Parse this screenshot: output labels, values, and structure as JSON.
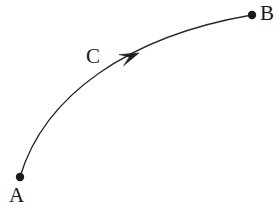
{
  "figure": {
    "width": 280,
    "height": 211,
    "background_color": "#ffffff",
    "stroke_color": "#2b2b2b",
    "stroke_width": 1.4
  },
  "labels": {
    "start": "A",
    "end": "B",
    "path": "C"
  },
  "points": [
    {
      "name": "point-a",
      "label": "A",
      "x": 20,
      "y": 177,
      "radius": 4.2
    },
    {
      "name": "point-b",
      "label": "B",
      "x": 252,
      "y": 15,
      "radius": 4.2
    }
  ],
  "curve": {
    "name": "arc-a-to-b",
    "from": {
      "x": 20,
      "y": 177
    },
    "to": {
      "x": 252,
      "y": 15
    },
    "control_1": {
      "x": 44,
      "y": 96
    },
    "control_2": {
      "x": 128,
      "y": 36
    },
    "direction": "A to B"
  },
  "arrowhead": {
    "name": "direction-arrowhead",
    "tip_x": 139,
    "tip_y": 53,
    "angle_deg": -22,
    "length": 19,
    "half_width": 6
  }
}
